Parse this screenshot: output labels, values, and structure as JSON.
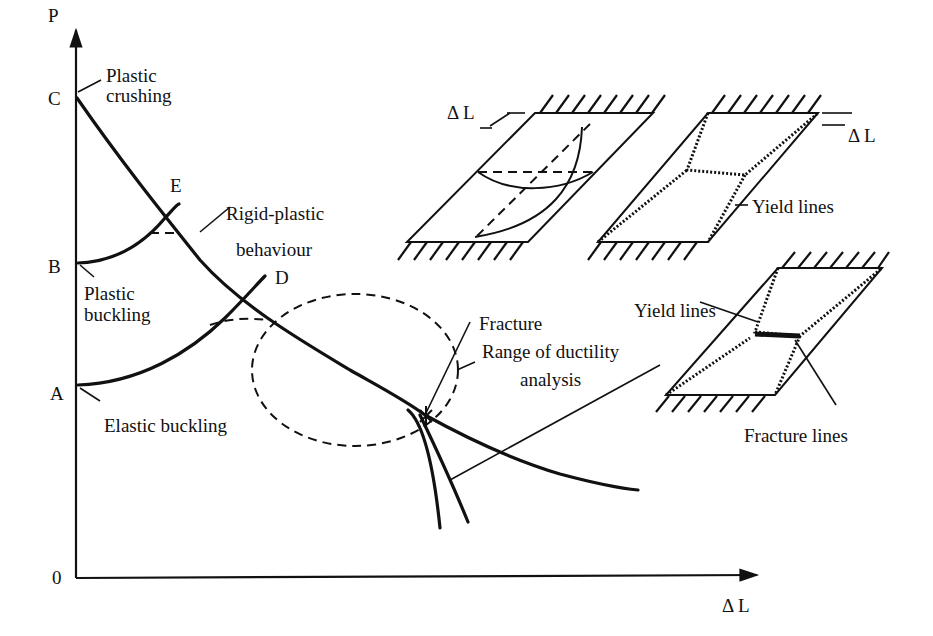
{
  "axes": {
    "y_label": "P",
    "x_label": "Δ L",
    "origin_label": "0"
  },
  "points": {
    "C": "C",
    "B": "B",
    "A": "A",
    "E": "E",
    "D": "D"
  },
  "annotations": {
    "plastic_crushing_line1": "Plastic",
    "plastic_crushing_line2": "crushing",
    "plastic_buckling_line1": "Plastic",
    "plastic_buckling_line2": "buckling",
    "elastic_buckling": "Elastic buckling",
    "rigid_plastic_line1": "Rigid-plastic",
    "rigid_plastic_line2": "behaviour",
    "fracture": "Fracture",
    "range_line1": "Range of ductility",
    "range_line2": "analysis"
  },
  "insets": {
    "plate1_delta": "Δ L",
    "plate2_delta": "Δ L",
    "plate2_yield": "Yield lines",
    "plate3_yield": "Yield lines",
    "plate3_fracture": "Fracture lines"
  }
}
